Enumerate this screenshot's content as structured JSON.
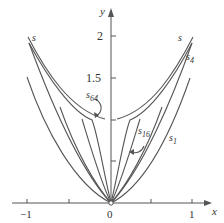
{
  "figure": {
    "axes": {
      "x_label": "x",
      "y_label": "y",
      "x_ticks": [
        {
          "value": -1,
          "label": "−1"
        },
        {
          "value": -0.5,
          "label": ""
        },
        {
          "value": 0,
          "label": "0"
        },
        {
          "value": 0.5,
          "label": ""
        },
        {
          "value": 1,
          "label": "1"
        }
      ],
      "y_ticks": [
        {
          "value": 1,
          "label": ""
        },
        {
          "value": 1.5,
          "label": "1.5"
        },
        {
          "value": 2,
          "label": "2"
        }
      ]
    },
    "curves": [
      {
        "name": "s",
        "label_main": "s",
        "label_sub": ""
      },
      {
        "name": "s_1",
        "label_main": "s",
        "label_sub": "1"
      },
      {
        "name": "s_4",
        "label_main": "s",
        "label_sub": "4"
      },
      {
        "name": "s_16",
        "label_main": "s",
        "label_sub": "16"
      },
      {
        "name": "s_64",
        "label_main": "s",
        "label_sub": "64"
      }
    ],
    "labels": {
      "s_left": "s",
      "s_right": "s",
      "s4_main": "s",
      "s4_sub": "4",
      "s1_main": "s",
      "s1_sub": "1",
      "s16_main": "s",
      "s16_sub": "16",
      "s64_main": "s",
      "s64_sub": "64",
      "origin": "0",
      "x_neg1": "−1",
      "x_pos1": "1",
      "y_2": "2",
      "y_1_5": "1.5",
      "x_axis": "x",
      "y_axis": "y"
    },
    "colors": {
      "curve": "#555555",
      "axis": "#555555",
      "text": "#333333"
    }
  }
}
